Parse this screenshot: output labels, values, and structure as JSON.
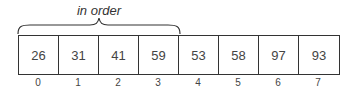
{
  "annotation": {
    "text": "in order",
    "spans_indices": [
      0,
      3
    ]
  },
  "array": {
    "values": [
      "26",
      "31",
      "41",
      "59",
      "53",
      "58",
      "97",
      "93"
    ],
    "indices": [
      "0",
      "1",
      "2",
      "3",
      "4",
      "5",
      "6",
      "7"
    ]
  }
}
